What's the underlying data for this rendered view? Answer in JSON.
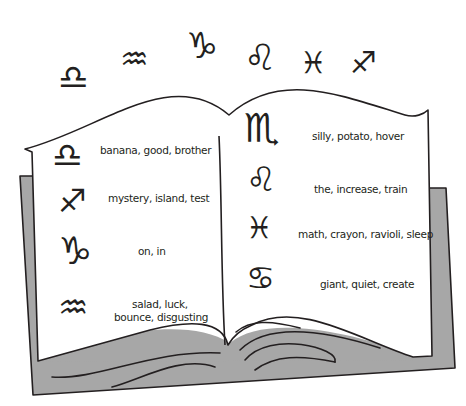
{
  "top_symbols": [
    {
      "name": "libra",
      "glyph": "♎"
    },
    {
      "name": "aquarius",
      "glyph": "♒"
    },
    {
      "name": "capricorn",
      "glyph": "♑"
    },
    {
      "name": "leo",
      "glyph": "♌"
    },
    {
      "name": "pisces",
      "glyph": "♓"
    },
    {
      "name": "sagittarius",
      "glyph": "♐"
    }
  ],
  "left_page": [
    {
      "sign": "libra",
      "glyph": "♎",
      "words": "banana, good, brother"
    },
    {
      "sign": "sagittarius",
      "glyph": "♐",
      "words": "mystery, island, test"
    },
    {
      "sign": "capricorn",
      "glyph": "♑",
      "words": "on, in"
    },
    {
      "sign": "aquarius",
      "glyph": "♒",
      "words_line1": "salad, luck,",
      "words_line2": "bounce, disgusting"
    }
  ],
  "right_page": [
    {
      "sign": "scorpio",
      "glyph": "♏",
      "words": "silly, potato, hover"
    },
    {
      "sign": "leo",
      "glyph": "♌",
      "words": "the, increase, train"
    },
    {
      "sign": "pisces",
      "glyph": "♓",
      "words": "math, crayon, ravioli, sleep"
    },
    {
      "sign": "cancer",
      "glyph": "♋",
      "words": "giant, quiet, create"
    }
  ],
  "colors": {
    "ink": "#231f20",
    "cover": "#a7a7a7",
    "page": "#ffffff"
  }
}
